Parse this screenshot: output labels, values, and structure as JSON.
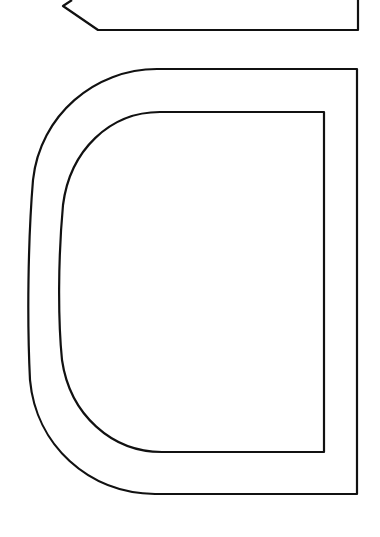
{
  "canvas": {
    "width": 380,
    "height": 537,
    "background": "#ffffff"
  },
  "stroke": {
    "color": "#111111",
    "width": 2.2
  },
  "shapes": {
    "pointer_tab": {
      "description": "pencil-tip / arrow-tab outline at top"
    },
    "outer_d": {
      "description": "outer rounded D-shaped outline"
    },
    "inner_d": {
      "description": "inner rounded D-shaped outline"
    }
  }
}
